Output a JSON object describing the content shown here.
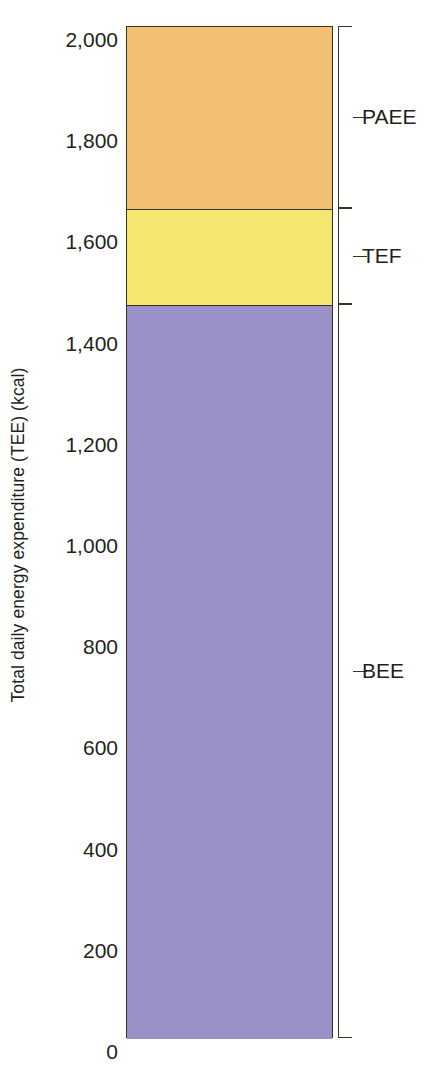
{
  "chart_data": {
    "type": "bar",
    "subtype": "stacked-single-bar",
    "title": "",
    "xlabel": "",
    "ylabel": "Total daily energy expenditure (TEE) (kcal)",
    "ylim": [
      0,
      2000
    ],
    "grid": false,
    "legend_position": "right-brackets",
    "categories": [
      "Total daily energy expenditure (TEE)"
    ],
    "ytick_labels": [
      "2,000",
      "1,800",
      "1,600",
      "1,400",
      "1,200",
      "1,000",
      "800",
      "600",
      "400",
      "200",
      "0"
    ],
    "ytick_values": [
      2000,
      1800,
      1600,
      1400,
      1200,
      1000,
      800,
      600,
      400,
      200,
      0
    ],
    "series": [
      {
        "name": "BEE",
        "value": 1450,
        "range": [
          0,
          1450
        ],
        "color": "#9b93c9"
      },
      {
        "name": "TEF",
        "value": 190,
        "range": [
          1450,
          1640
        ],
        "color": "#f7e871"
      },
      {
        "name": "PAEE",
        "value": 360,
        "range": [
          1640,
          2000
        ],
        "color": "#f5c173"
      }
    ],
    "total": 2000,
    "units": "kcal"
  },
  "axis": {
    "title": "Total daily energy expenditure (TEE) (kcal)",
    "ticks": [
      {
        "label": "2,000",
        "value": 2000
      },
      {
        "label": "1,800",
        "value": 1800
      },
      {
        "label": "1,600",
        "value": 1600
      },
      {
        "label": "1,400",
        "value": 1400
      },
      {
        "label": "1,200",
        "value": 1200
      },
      {
        "label": "1,000",
        "value": 1000
      },
      {
        "label": "800",
        "value": 800
      },
      {
        "label": "600",
        "value": 600
      },
      {
        "label": "400",
        "value": 400
      },
      {
        "label": "200",
        "value": 200
      },
      {
        "label": "0",
        "value": 0
      }
    ]
  },
  "brackets": [
    {
      "label": "PAEE",
      "from": 1640,
      "to": 2000
    },
    {
      "label": "TEF",
      "from": 1450,
      "to": 1640
    },
    {
      "label": "BEE",
      "from": 0,
      "to": 1450
    }
  ],
  "colors": {
    "paee": "#f5c173",
    "tef": "#f7e871",
    "bee": "#9b93c9",
    "outline": "#3b3226",
    "text": "#231f20",
    "background": "#ffffff"
  }
}
